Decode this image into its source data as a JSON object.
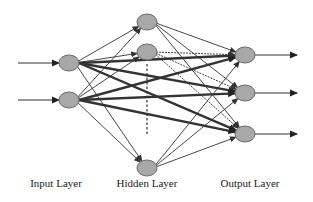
{
  "diagram": {
    "type": "neural-network",
    "labels": {
      "input": "Input Layer",
      "hidden": "Hidden Layer",
      "output": "Output Layer"
    },
    "colors": {
      "node_fill": "#a8a8a8",
      "node_stroke": "#6a6a6a",
      "edge": "#333333",
      "background": "#ffffff"
    },
    "layers": {
      "input": [
        {
          "id": "i1",
          "x": 69,
          "y": 63
        },
        {
          "id": "i2",
          "x": 69,
          "y": 100
        }
      ],
      "hidden": [
        {
          "id": "h1",
          "x": 147,
          "y": 22
        },
        {
          "id": "h2",
          "x": 147,
          "y": 52
        },
        {
          "id": "h3",
          "x": 147,
          "y": 168
        }
      ],
      "output": [
        {
          "id": "o1",
          "x": 245,
          "y": 55
        },
        {
          "id": "o2",
          "x": 245,
          "y": 93
        },
        {
          "id": "o3",
          "x": 245,
          "y": 134
        }
      ]
    },
    "ellipsis_between_hidden": "dashed vertical line"
  }
}
